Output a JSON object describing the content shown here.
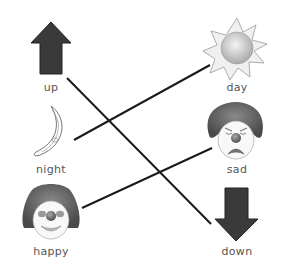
{
  "left_items": [
    {
      "label": "up",
      "icon": "up-arrow-icon"
    },
    {
      "label": "night",
      "icon": "moon-icon"
    },
    {
      "label": "happy",
      "icon": "happy-clown-icon"
    }
  ],
  "right_items": [
    {
      "label": "day",
      "icon": "sun-icon"
    },
    {
      "label": "sad",
      "icon": "sad-clown-icon"
    },
    {
      "label": "down",
      "icon": "down-arrow-icon"
    }
  ],
  "connections": [
    {
      "from": "up",
      "to": "down"
    },
    {
      "from": "night",
      "to": "day"
    },
    {
      "from": "happy",
      "to": "sad"
    }
  ],
  "colors": {
    "line": "#1a1a1a",
    "arrow": "#3a3a3a",
    "label": "#555555"
  }
}
